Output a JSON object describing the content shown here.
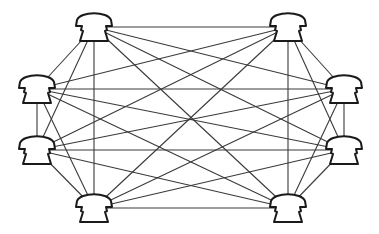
{
  "diagram": {
    "type": "fully-connected mesh network",
    "node_icon": "telephone-icon",
    "colors": {
      "line": "#3a3a3a",
      "phone_outline": "#1a1a1a",
      "background": "#ffffff"
    },
    "nodes": [
      {
        "id": "top-left",
        "x": 94,
        "y": 27
      },
      {
        "id": "top-right",
        "x": 288,
        "y": 27
      },
      {
        "id": "left-upper",
        "x": 37,
        "y": 89
      },
      {
        "id": "left-lower",
        "x": 37,
        "y": 150
      },
      {
        "id": "right-upper",
        "x": 344,
        "y": 89
      },
      {
        "id": "right-lower",
        "x": 344,
        "y": 150
      },
      {
        "id": "bottom-left",
        "x": 94,
        "y": 208
      },
      {
        "id": "bottom-right",
        "x": 288,
        "y": 208
      }
    ],
    "edges": "all-pairs"
  }
}
